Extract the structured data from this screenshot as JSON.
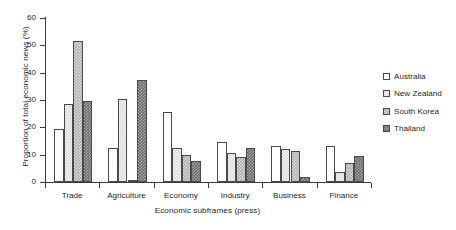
{
  "chart_data": {
    "type": "bar",
    "title": "",
    "subtitle": "",
    "xlabel": "Economic subframes (press)",
    "ylabel": "Proportion of total economic news (%)",
    "categories": [
      "Trade",
      "Agriculture",
      "Economy",
      "Industry",
      "Business",
      "Finance"
    ],
    "series": [
      {
        "name": "Australia",
        "color": "#ffffff",
        "values": [
          19.5,
          12.4,
          25.7,
          14.7,
          13.3,
          13.2
        ]
      },
      {
        "name": "New Zealand",
        "color": "#dcdcdc",
        "values": [
          28.4,
          30.5,
          12.5,
          10.6,
          12.2,
          3.7
        ]
      },
      {
        "name": "South Korea",
        "color": "#b0b0b0",
        "values": [
          51.7,
          0.6,
          9.8,
          9.1,
          11.2,
          6.8
        ]
      },
      {
        "name": "Thailand",
        "color": "#6e6e6e",
        "values": [
          29.5,
          37.5,
          7.6,
          12.3,
          1.9,
          9.4
        ]
      }
    ],
    "ylim": [
      0,
      60
    ],
    "yticks": [
      0,
      10,
      20,
      30,
      40,
      50,
      60
    ],
    "ytick_labels": [
      "0",
      "10",
      "20",
      "30",
      "40",
      "50",
      "60"
    ],
    "grid": false,
    "legend_position": "right",
    "legend_entries": [
      "Australia",
      "New Zealand",
      "South Korea",
      "Thailand"
    ]
  }
}
